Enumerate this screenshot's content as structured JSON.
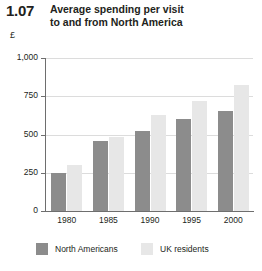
{
  "figure": {
    "number": "1.07",
    "title_line1": "Average spending per visit",
    "title_line2": "to and from North America",
    "unit": "£"
  },
  "colors": {
    "north_americans": "#8c8c8c",
    "uk_residents": "#e7e7e7",
    "gridline": "#dcdcdc",
    "axis": "#6e6e6e",
    "text": "#231f20"
  },
  "chart_data": {
    "type": "bar",
    "title": "Average spending per visit to and from North America",
    "subtitle": "1.07",
    "xlabel": "",
    "ylabel": "£",
    "categories": [
      "1980",
      "1985",
      "1990",
      "1995",
      "2000"
    ],
    "series": [
      {
        "name": "North Americans",
        "color": "#8c8c8c",
        "values": [
          248,
          458,
          521,
          600,
          655
        ]
      },
      {
        "name": "UK residents",
        "color": "#e7e7e7",
        "values": [
          303,
          484,
          628,
          716,
          823
        ]
      }
    ],
    "ylim": [
      0,
      1000
    ],
    "yticks": [
      0,
      250,
      500,
      750,
      1000
    ],
    "ytick_labels": [
      "0",
      "250",
      "500",
      "750",
      "1,000"
    ],
    "grid": true,
    "legend_position": "bottom"
  }
}
